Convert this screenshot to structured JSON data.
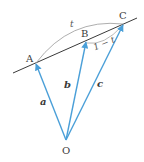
{
  "diagram": {
    "points": {
      "A": {
        "label": "A"
      },
      "B": {
        "label": "B"
      },
      "C": {
        "label": "C"
      },
      "O": {
        "label": "O"
      }
    },
    "vectors": {
      "a": {
        "label": "a"
      },
      "b": {
        "label": "b"
      },
      "c": {
        "label": "c"
      }
    },
    "segments": {
      "AC": {
        "label": "t"
      },
      "BC": {
        "label": "1 − t"
      }
    },
    "colors": {
      "vector": "#4a9fd8",
      "line": "#3a3a3a",
      "arc": "#888888"
    }
  }
}
